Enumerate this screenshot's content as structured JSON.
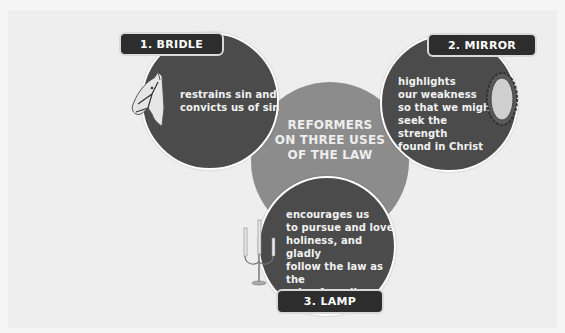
{
  "diagram": {
    "center": {
      "title_lines": [
        "REFORMERS",
        "ON THREE USES",
        "OF THE LAW"
      ]
    },
    "uses": [
      {
        "label": "1. BRIDLE",
        "icon": "horse-bridle-icon",
        "description_lines": [
          "restrains sin and",
          "convicts us of sin"
        ]
      },
      {
        "label": "2. MIRROR",
        "icon": "mirror-icon",
        "description_lines": [
          "highlights",
          "our weakness",
          "so that we might",
          "seek the strength",
          "found in Christ"
        ]
      },
      {
        "label": "3. LAMP",
        "icon": "candelabra-icon",
        "description_lines": [
          "encourages us",
          "to pursue and love",
          "holiness, and gladly",
          "follow the law as the",
          "rule of our lives"
        ]
      }
    ],
    "colors": {
      "background": "#eeeeee",
      "center_circle": "#8c8c8c",
      "use_circle": "#4b4b4b",
      "label_pill": "#2d2d2d",
      "text": "#ffffff"
    }
  }
}
